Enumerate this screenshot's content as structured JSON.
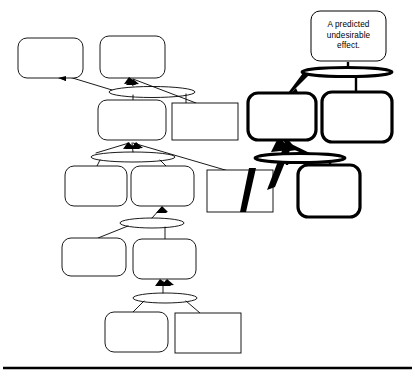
{
  "diagram": {
    "type": "logic-tree",
    "title_text_visible": false,
    "background_color": "#ffffff",
    "stroke_color": "#000000",
    "thin_stroke_width": 0.9,
    "bold_stroke_width": 3.2,
    "labels": {
      "predicted_effect": "A predicted\nundesirable\neffect."
    },
    "nodes": [
      {
        "id": "n-top-left",
        "name": "effect-box-top-left",
        "shape": "rounded-rect",
        "weight": "thin",
        "x": 18,
        "y": 38,
        "w": 65,
        "h": 40,
        "text": ""
      },
      {
        "id": "n-top-mid",
        "name": "effect-box-top-middle",
        "shape": "rounded-rect",
        "weight": "thin",
        "x": 100,
        "y": 36,
        "w": 65,
        "h": 42,
        "text": ""
      },
      {
        "id": "n-row2-left",
        "name": "effect-box-row2-left",
        "shape": "rounded-rect",
        "weight": "thin",
        "x": 98,
        "y": 100,
        "w": 68,
        "h": 40,
        "text": ""
      },
      {
        "id": "n-row2-rect",
        "name": "cause-rect-row2-right",
        "shape": "square-rect",
        "weight": "thin",
        "x": 172,
        "y": 103,
        "w": 66,
        "h": 37,
        "text": ""
      },
      {
        "id": "n-row3-left",
        "name": "effect-box-row3-left",
        "shape": "rounded-rect",
        "weight": "thin",
        "x": 65,
        "y": 166,
        "w": 62,
        "h": 40,
        "text": ""
      },
      {
        "id": "n-row3-mid",
        "name": "effect-box-row3-middle",
        "shape": "rounded-rect",
        "weight": "thin",
        "x": 131,
        "y": 166,
        "w": 63,
        "h": 40,
        "text": ""
      },
      {
        "id": "n-row3-rect",
        "name": "cause-rect-row3-right",
        "shape": "square-rect",
        "weight": "thin",
        "x": 207,
        "y": 170,
        "w": 66,
        "h": 42,
        "text": ""
      },
      {
        "id": "n-row4-left",
        "name": "effect-box-row4-left",
        "shape": "rounded-rect",
        "weight": "thin",
        "x": 62,
        "y": 238,
        "w": 64,
        "h": 38,
        "text": ""
      },
      {
        "id": "n-row4-mid",
        "name": "effect-box-row4-middle",
        "shape": "rounded-rect",
        "weight": "thin",
        "x": 133,
        "y": 239,
        "w": 63,
        "h": 40,
        "text": ""
      },
      {
        "id": "n-row5-left",
        "name": "effect-box-row5-left",
        "shape": "rounded-rect",
        "weight": "thin",
        "x": 105,
        "y": 312,
        "w": 63,
        "h": 40,
        "text": ""
      },
      {
        "id": "n-row5-rect",
        "name": "cause-rect-row5-right",
        "shape": "square-rect",
        "weight": "thin",
        "x": 175,
        "y": 313,
        "w": 66,
        "h": 40,
        "text": ""
      },
      {
        "id": "n-predicted",
        "name": "predicted-effect-box",
        "shape": "rounded-rect",
        "weight": "thin",
        "x": 311,
        "y": 11,
        "w": 75,
        "h": 50,
        "text": "A predicted\nundesirable\neffect."
      },
      {
        "id": "n-bold-left",
        "name": "injection-box-bold-left",
        "shape": "rounded-rect",
        "weight": "bold",
        "x": 248,
        "y": 93,
        "w": 68,
        "h": 47,
        "text": ""
      },
      {
        "id": "n-bold-right",
        "name": "injection-box-bold-right",
        "shape": "rounded-rect",
        "weight": "bold",
        "x": 322,
        "y": 92,
        "w": 70,
        "h": 50,
        "text": ""
      },
      {
        "id": "n-bold-bottom",
        "name": "injection-box-bold-bottom",
        "shape": "rounded-rect",
        "weight": "bold",
        "x": 298,
        "y": 165,
        "w": 62,
        "h": 52,
        "text": ""
      }
    ],
    "connectors": [
      {
        "id": "e1",
        "name": "and-connector-row2",
        "shape": "ellipse",
        "weight": "thin",
        "cx": 152,
        "cy": 92,
        "rx": 43,
        "ry": 5.5
      },
      {
        "id": "e2",
        "name": "and-connector-row3",
        "shape": "ellipse",
        "weight": "thin",
        "cx": 133,
        "cy": 157,
        "rx": 42,
        "ry": 5.0
      },
      {
        "id": "e3",
        "name": "and-connector-row4",
        "shape": "ellipse",
        "weight": "thin",
        "cx": 152,
        "cy": 223,
        "rx": 32,
        "ry": 5.0
      },
      {
        "id": "e4",
        "name": "and-connector-row5",
        "shape": "ellipse",
        "weight": "thin",
        "cx": 165,
        "cy": 298,
        "rx": 32,
        "ry": 5.0
      },
      {
        "id": "e5",
        "name": "and-connector-bold-top",
        "shape": "ellipse",
        "weight": "bold",
        "cx": 347,
        "cy": 72,
        "rx": 45,
        "ry": 4.5
      },
      {
        "id": "e6",
        "name": "and-connector-bold-bottom",
        "shape": "ellipse",
        "weight": "bold",
        "cx": 300,
        "cy": 158,
        "rx": 45,
        "ry": 4.5
      }
    ],
    "arrows": [
      {
        "name": "arrow-to-top-left",
        "weight": "thin"
      },
      {
        "name": "arrow-to-top-middle",
        "weight": "thin"
      },
      {
        "name": "arrow-to-row2-left",
        "weight": "thin"
      },
      {
        "name": "arrow-to-row3-mid",
        "weight": "thin"
      },
      {
        "name": "arrow-to-row4-mid",
        "weight": "thin"
      },
      {
        "name": "arrow-bold-to-injection-left",
        "weight": "bold"
      },
      {
        "name": "arrow-bold-to-predicted",
        "weight": "bold"
      }
    ],
    "footer_rule": {
      "name": "footer-divider",
      "y": 368,
      "x1": 3,
      "x2": 412,
      "thickness": 2.4
    }
  }
}
